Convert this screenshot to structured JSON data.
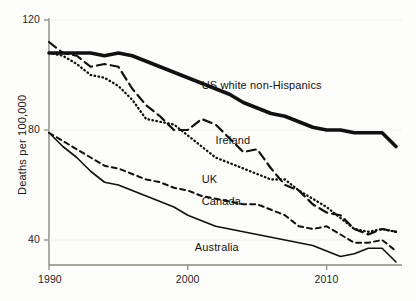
{
  "chart_data": {
    "type": "line",
    "title": "",
    "subtitle": "",
    "xlabel": "",
    "ylabel": "Deaths per 100,000",
    "xlim": [
      1990,
      2015
    ],
    "ylim": [
      30,
      125
    ],
    "grid": false,
    "legend_position": "inline-annotations",
    "x_ticks": [
      1990,
      2000,
      2010
    ],
    "x_tick_labels": [
      "1990",
      "2000",
      "2010"
    ],
    "y_ticks": [
      40,
      80,
      120
    ],
    "y_tick_labels": [
      "40",
      "80",
      "120"
    ],
    "x": [
      1990,
      1991,
      1992,
      1993,
      1994,
      1995,
      1996,
      1997,
      1998,
      1999,
      2000,
      2001,
      2002,
      2003,
      2004,
      2005,
      2006,
      2007,
      2008,
      2009,
      2010,
      2011,
      2012,
      2013,
      2014,
      2015
    ],
    "series": [
      {
        "name": "US white non-Hispanics",
        "style": "solid-thick",
        "label_x": 2001.0,
        "label_y": 96,
        "values": [
          108,
          108,
          108,
          108,
          107,
          108,
          107,
          105,
          103,
          101,
          99,
          97,
          95,
          93,
          90,
          88,
          86,
          85,
          83,
          81,
          80,
          80,
          79,
          79,
          79,
          74
        ]
      },
      {
        "name": "Ireland",
        "style": "dashed-long",
        "label_x": 2002.0,
        "label_y": 76,
        "values": [
          112,
          108,
          107,
          103,
          104,
          103,
          95,
          89,
          85,
          80,
          80,
          84,
          82,
          77,
          72,
          73,
          66,
          60,
          58,
          53,
          50,
          49,
          44,
          42,
          44,
          43
        ]
      },
      {
        "name": "UK",
        "style": "dotted",
        "label_x": 2001.0,
        "label_y": 62,
        "values": [
          108,
          107,
          104,
          100,
          99,
          96,
          91,
          84,
          83,
          82,
          78,
          74,
          70,
          68,
          66,
          64,
          62,
          62,
          58,
          55,
          52,
          48,
          44,
          43,
          44,
          43
        ]
      },
      {
        "name": "Canada",
        "style": "dashed-short",
        "label_x": 2001.0,
        "label_y": 54,
        "values": [
          79,
          76,
          73,
          70,
          67,
          66,
          64,
          62,
          61,
          59,
          58,
          56,
          55,
          54,
          53,
          53,
          51,
          49,
          45,
          44,
          45,
          42,
          39,
          39,
          40,
          36
        ]
      },
      {
        "name": "Australia",
        "style": "solid-thin",
        "label_x": 2000.5,
        "label_y": 37,
        "values": [
          79,
          74,
          70,
          65,
          61,
          60,
          58,
          56,
          54,
          52,
          49,
          47,
          45,
          44,
          43,
          42,
          41,
          40,
          39,
          38,
          36,
          34,
          35,
          37,
          37,
          32
        ]
      }
    ],
    "annotations": [
      {
        "text": "US white non-Hispanics"
      },
      {
        "text": "Ireland"
      },
      {
        "text": "UK"
      },
      {
        "text": "Canada"
      },
      {
        "text": "Australia"
      }
    ]
  },
  "axis": {
    "y_title": "Deaths per 100,000",
    "y_tick_0": "120",
    "y_tick_1": "80",
    "y_tick_2": "40",
    "x_tick_0": "1990",
    "x_tick_1": "2000",
    "x_tick_2": "2010"
  },
  "labels": {
    "us": "US white non-Hispanics",
    "ireland": "Ireland",
    "uk": "UK",
    "canada": "Canada",
    "australia": "Australia"
  },
  "colors": {
    "line": "#111111",
    "axis": "#8a8a85",
    "text": "#1a1a1a",
    "background": "#fdfdfc"
  }
}
